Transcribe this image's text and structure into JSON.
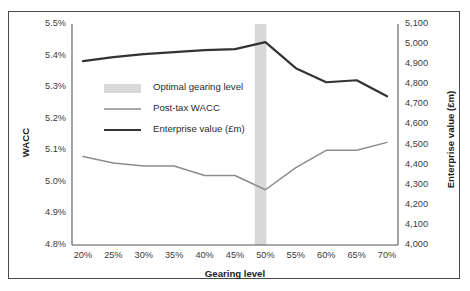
{
  "chart_data": {
    "type": "line",
    "title": "",
    "subtitle": "",
    "xlabel": "Gearing level",
    "ylabel": "WACC",
    "y2label": "Enterprise value (£m)",
    "x": [
      "20%",
      "25%",
      "30%",
      "35%",
      "40%",
      "45%",
      "50%",
      "55%",
      "60%",
      "65%",
      "70%"
    ],
    "x_numeric": [
      20,
      25,
      30,
      35,
      40,
      45,
      50,
      55,
      60,
      65,
      70
    ],
    "ylim": [
      4.8,
      5.5
    ],
    "y2lim": [
      4000,
      5100
    ],
    "yticks": [
      "4.8%",
      "4.9%",
      "5.0%",
      "5.1%",
      "5.2%",
      "5.3%",
      "5.4%",
      "5.5%"
    ],
    "ytick_values": [
      4.8,
      4.9,
      5.0,
      5.1,
      5.2,
      5.3,
      5.4,
      5.5
    ],
    "y2ticks": [
      "4,000",
      "4,100",
      "4,200",
      "4,300",
      "4,400",
      "4,500",
      "4,600",
      "4,700",
      "4,800",
      "4,900",
      "5,000",
      "5,100"
    ],
    "y2tick_values": [
      4000,
      4100,
      4200,
      4300,
      4400,
      4500,
      4600,
      4700,
      4800,
      4900,
      5000,
      5100
    ],
    "grid": false,
    "legend_position": "inside-upper-left",
    "series": [
      {
        "name": "Post-tax WACC",
        "axis": "left",
        "color": "#8c8c8c",
        "width": 1.5,
        "values": [
          5.08,
          5.06,
          5.05,
          5.05,
          5.02,
          5.02,
          4.975,
          5.045,
          5.1,
          5.1,
          5.125
        ]
      },
      {
        "name": "Enterprise value (£m)",
        "axis": "right",
        "color": "#333333",
        "width": 2.2,
        "values": [
          4915,
          4935,
          4950,
          4960,
          4970,
          4975,
          5010,
          4880,
          4810,
          4820,
          4740
        ]
      }
    ],
    "annotations": [
      {
        "name": "Optimal gearing level",
        "type": "vband",
        "x_center": 49.2,
        "x_half_width": 0.95,
        "color": "#d6d6d6"
      }
    ],
    "legend": [
      {
        "label": "Optimal gearing level",
        "marker": "band",
        "color": "#d9d9d9"
      },
      {
        "label": "Post-tax WACC",
        "marker": "line",
        "color": "#8c8c8c"
      },
      {
        "label": "Enterprise value (£m)",
        "marker": "line",
        "color": "#333333"
      }
    ],
    "axis_color": "#555555",
    "frame_color": "#4a4a4a",
    "background": "#ffffff"
  }
}
